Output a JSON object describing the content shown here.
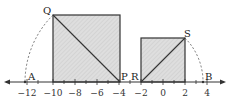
{
  "diagram": {
    "type": "number-line-geometry",
    "axis": {
      "ticks": [
        -12,
        -10,
        -8,
        -6,
        -4,
        -2,
        0,
        2,
        4
      ],
      "tick_labels": [
        "−12",
        "−10",
        "−8",
        "−6",
        "−4",
        "−2",
        "0",
        "2",
        "4"
      ],
      "min": -13,
      "max": 5
    },
    "points": {
      "A": {
        "label": "A"
      },
      "B": {
        "label": "B"
      },
      "P": {
        "label": "P",
        "value": -4
      },
      "Q": {
        "label": "Q"
      },
      "R": {
        "label": "R",
        "value": -2
      },
      "S": {
        "label": "S"
      }
    },
    "squares": [
      {
        "name": "large-square",
        "from": -10,
        "to": -4,
        "diagonal": "Q-P"
      },
      {
        "name": "small-square",
        "from": -2,
        "to": 2,
        "diagonal": "R-S"
      }
    ],
    "colors": {
      "fill": "#d9d9d9",
      "stroke": "#333333",
      "arc": "#555555"
    }
  }
}
